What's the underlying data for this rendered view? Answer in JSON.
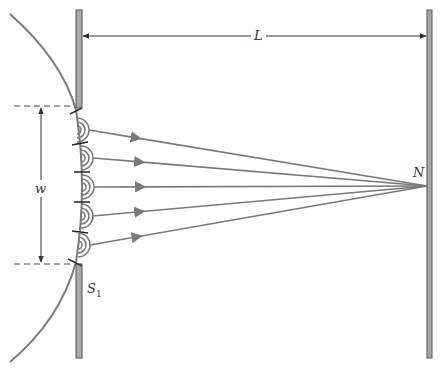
{
  "labels": {
    "distance": "L",
    "width": "w",
    "point": "N",
    "source": "S",
    "source_sub": "1"
  },
  "colors": {
    "line": "#7a7a7a",
    "wall_fill": "#a8a8a8",
    "wall_stroke": "#555555",
    "dim": "#444444",
    "background": "#ffffff"
  },
  "geometry": {
    "slit_wall": {
      "x": 76,
      "w": 6,
      "top_y1": 10,
      "top_y2": 108,
      "bot_y1": 262,
      "bot_y2": 358
    },
    "screen": {
      "x": 427,
      "w": 5,
      "y1": 10,
      "y2": 358
    },
    "focus": {
      "x": 427,
      "y": 186
    },
    "wavelet_sources": [
      {
        "x": 77,
        "y": 130
      },
      {
        "x": 81,
        "y": 158
      },
      {
        "x": 82,
        "y": 187
      },
      {
        "x": 81,
        "y": 216
      },
      {
        "x": 78,
        "y": 245
      }
    ]
  }
}
